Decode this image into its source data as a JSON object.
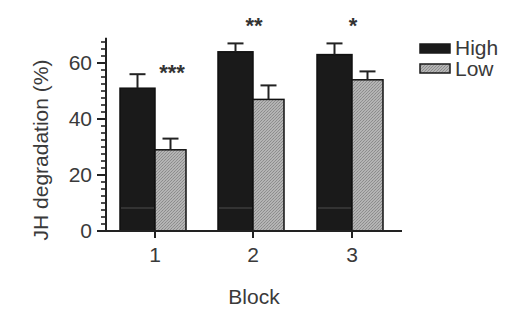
{
  "chart_data": {
    "type": "bar",
    "title": "",
    "xlabel": "Block",
    "ylabel": "JH degradation (%)",
    "categories": [
      "1",
      "2",
      "3"
    ],
    "series": [
      {
        "name": "High",
        "values": [
          51,
          64,
          63
        ],
        "errors": [
          5,
          3,
          4
        ],
        "color": "#1a1a1a",
        "pattern": "solid"
      },
      {
        "name": "Low",
        "values": [
          29,
          47,
          54
        ],
        "errors": [
          4,
          5,
          3
        ],
        "color": "#a8a8a8",
        "pattern": "fine-hatch"
      }
    ],
    "significance": [
      "***",
      "**",
      "*"
    ],
    "ylim": [
      0,
      69
    ],
    "yticks": [
      0,
      20,
      40,
      60
    ],
    "minor_tick_step": 2.5,
    "grid": false,
    "legend_position": "upper-right-outside",
    "error_bars": "upper only (SE)"
  },
  "legend": {
    "items": [
      {
        "label": "High",
        "color": "#1a1a1a"
      },
      {
        "label": "Low",
        "color": "#a8a8a8"
      }
    ]
  },
  "axes": {
    "x_title": "Block",
    "y_title": "JH degradation (%)",
    "x_tick_labels": [
      "1",
      "2",
      "3"
    ],
    "y_tick_labels": [
      "0",
      "20",
      "40",
      "60"
    ]
  },
  "colors": {
    "axis": "#2a2a2a",
    "text": "#3a3a3a",
    "high": "#1a1a1a",
    "low": "#a8a8a8"
  }
}
